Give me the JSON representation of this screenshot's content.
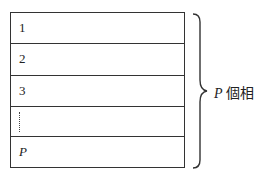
{
  "diagram": {
    "rows": [
      {
        "label": "1",
        "italic": false,
        "dots": false
      },
      {
        "label": "2",
        "italic": false,
        "dots": false
      },
      {
        "label": "3",
        "italic": false,
        "dots": false
      },
      {
        "label": "",
        "italic": false,
        "dots": true
      },
      {
        "label": "P",
        "italic": true,
        "dots": false
      }
    ],
    "group_label": {
      "variable": "P",
      "text": "個相"
    }
  }
}
